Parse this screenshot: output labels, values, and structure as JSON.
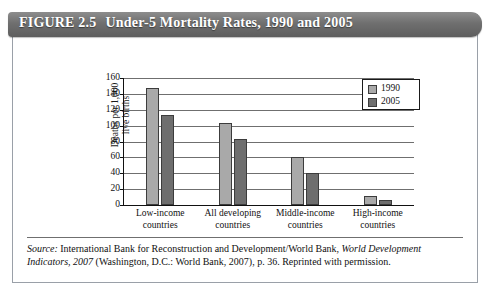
{
  "figure": {
    "number_label": "FIGURE 2.5",
    "title": "Under-5 Mortality Rates, 1990 and 2005"
  },
  "source": {
    "label": "Source:",
    "body_1": " International Bank for Reconstruction and Development/World Bank, ",
    "italic_title": "World Development Indicators, 2007",
    "body_2": " (Washington, D.C.: World Bank, 2007), p. 36. Reprinted with permission."
  },
  "legend": {
    "position": "top-right",
    "entries": [
      {
        "label": "1990",
        "color": "#a9a9a9"
      },
      {
        "label": "2005",
        "color": "#6e6e6e"
      }
    ]
  },
  "axis": {
    "ylabel_line1": "Deaths per 1,000",
    "ylabel_line2": "live births",
    "yticks": [
      "160",
      "140",
      "120",
      "100",
      "80",
      "60",
      "40",
      "20",
      "0"
    ]
  },
  "categories_display": [
    "Low-income\ncountries",
    "All developing\ncountries",
    "Middle-income\ncountries",
    "High-income\ncountries"
  ],
  "chart_data": {
    "type": "bar",
    "title": "Under-5 Mortality Rates, 1990 and 2005",
    "xlabel": "",
    "ylabel": "Deaths per 1,000 live births",
    "categories": [
      "Low-income countries",
      "All developing countries",
      "Middle-income countries",
      "High-income countries"
    ],
    "series": [
      {
        "name": "1990",
        "color": "#a9a9a9",
        "values": [
          148,
          103,
          60,
          11
        ]
      },
      {
        "name": "2005",
        "color": "#6e6e6e",
        "values": [
          113,
          83,
          40,
          6
        ]
      }
    ],
    "ylim": [
      0,
      160
    ],
    "ytick_step": 20,
    "grid": true,
    "legend_position": "top-right"
  }
}
